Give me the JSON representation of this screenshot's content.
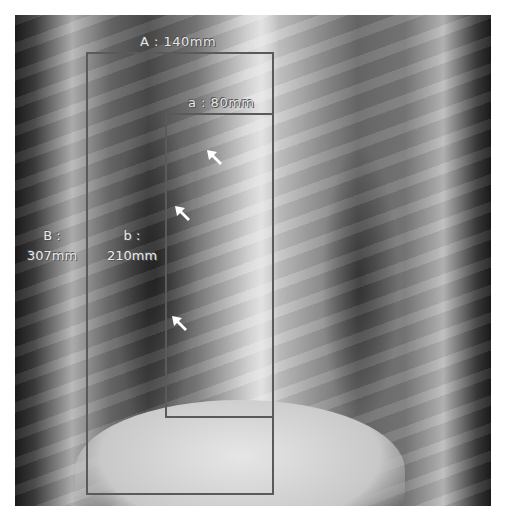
{
  "image": {
    "subject": "Chest X-ray (PA view)",
    "annotations": {
      "outer_box": {
        "label_width": "A : 140mm",
        "label_height_line1": "B :",
        "label_height_line2": "307mm"
      },
      "inner_box": {
        "label_width": "a : 80mm",
        "label_height_line1": "b :",
        "label_height_line2": "210mm"
      }
    },
    "arrows": [
      {
        "name": "arrow-1",
        "x": 215,
        "y": 155
      },
      {
        "name": "arrow-2",
        "x": 180,
        "y": 210
      },
      {
        "name": "arrow-3",
        "x": 178,
        "y": 320
      }
    ],
    "colors": {
      "box_stroke": "#5a5a5a",
      "label_text": "#e8e8e8",
      "arrow": "#ffffff"
    }
  }
}
